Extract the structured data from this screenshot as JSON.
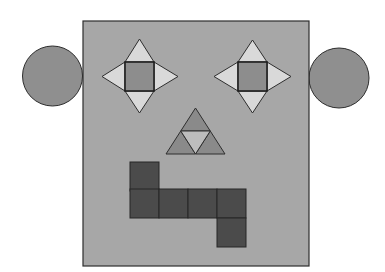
{
  "figure": {
    "title": "",
    "background": "#ffffff",
    "stroke": "#2e2e2e"
  },
  "head": {
    "shape": "square",
    "x": 83,
    "y": 21,
    "width": 226,
    "height": 245,
    "fill": "#a7a7a7"
  },
  "ears": [
    {
      "name": "left-ear",
      "shape": "circle",
      "cx": 52.5,
      "cy": 76,
      "r": 30,
      "fill": "#8f8f8f"
    },
    {
      "name": "right-ear",
      "shape": "circle",
      "cx": 339,
      "cy": 78,
      "r": 30,
      "fill": "#8f8f8f"
    }
  ],
  "eyes": [
    {
      "name": "left-eye",
      "square": {
        "x": 125,
        "y": 62,
        "size": 29,
        "fill": "#8d8d8d"
      },
      "tips": {
        "top": [
          139.5,
          39
        ],
        "bottom": [
          139.5,
          113
        ],
        "left": [
          102,
          76.5
        ],
        "right": [
          178,
          76.5
        ]
      },
      "triangle_fill": "#d9d9d9"
    },
    {
      "name": "right-eye",
      "square": {
        "x": 238,
        "y": 62,
        "size": 29,
        "fill": "#8d8d8d"
      },
      "tips": {
        "top": [
          252.5,
          40
        ],
        "bottom": [
          252.5,
          113
        ],
        "left": [
          214,
          76.5
        ],
        "right": [
          291,
          76.5
        ]
      },
      "triangle_fill": "#d9d9d9"
    }
  ],
  "nose": {
    "shape": "triangle-subdivided",
    "apex": [
      195.5,
      108
    ],
    "base_left": [
      166,
      154
    ],
    "base_right": [
      225,
      154
    ],
    "outer_fill": "#8a8a8a",
    "center_fill": "#bdbdbd"
  },
  "mouth": {
    "cell_size": 29,
    "fill": "#4b4b4b",
    "cells": [
      {
        "x": 130,
        "y": 162
      },
      {
        "x": 130,
        "y": 189
      },
      {
        "x": 159,
        "y": 189
      },
      {
        "x": 188,
        "y": 189
      },
      {
        "x": 217,
        "y": 189
      },
      {
        "x": 217,
        "y": 218
      }
    ]
  }
}
